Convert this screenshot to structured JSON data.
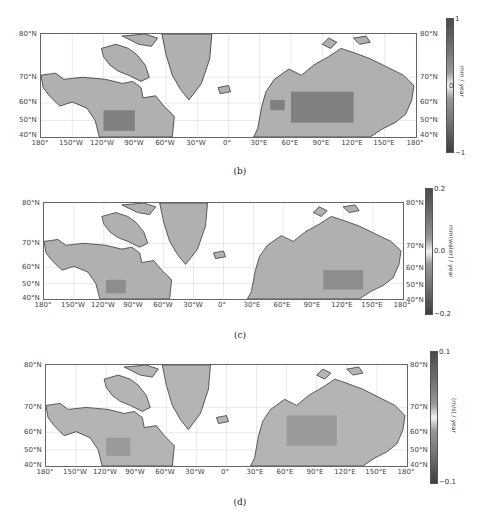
{
  "figure": {
    "panels": [
      {
        "id": "b",
        "caption": "(b)",
        "colorbar": {
          "max_label": "1",
          "mid_label": "0",
          "min_label": "−1",
          "unit": "mm / year"
        }
      },
      {
        "id": "c",
        "caption": "(c)",
        "colorbar": {
          "max_label": "0.2",
          "mid_label": "0.0",
          "min_label": "−0.2",
          "unit": "mm(water) / year"
        }
      },
      {
        "id": "d",
        "caption": "(d)",
        "colorbar": {
          "max_label": "0.1",
          "mid_label": "",
          "min_label": "−0.1",
          "unit": "(m/s) / year"
        }
      }
    ],
    "lat_labels": [
      "80°N",
      "70°N",
      "60°N",
      "50°N",
      "40°N"
    ],
    "lon_labels": [
      "180°",
      "150°W",
      "120°W",
      "90°W",
      "60°W",
      "30°W",
      "0°",
      "30°E",
      "60°E",
      "90°E",
      "120°E",
      "150°E",
      "180°"
    ],
    "colors": {
      "land": "#b4b4b4",
      "coast": "#333333",
      "grid": "#cccccc",
      "ocean": "#ffffff"
    }
  }
}
